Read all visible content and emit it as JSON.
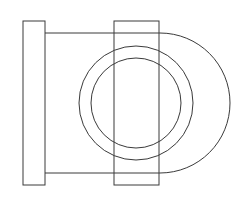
{
  "diagram": {
    "type": "technical-drawing",
    "stroke_color": "#3a3a3a",
    "background": "#ffffff",
    "left_flange": {
      "x": 23,
      "y": 21,
      "width": 22,
      "height": 164
    },
    "right_flange": {
      "x": 114,
      "y": 21,
      "width": 45,
      "height": 164
    },
    "top_line": {
      "x1": 45,
      "y1": 33,
      "x2": 160,
      "y2": 33
    },
    "bottom_line": {
      "x1": 45,
      "y1": 173,
      "x2": 160,
      "y2": 173
    },
    "outer_arc": {
      "cx": 160,
      "cy": 103,
      "r": 70
    },
    "middle_circle": {
      "cx": 136,
      "cy": 103,
      "r": 57
    },
    "inner_circle": {
      "cx": 136,
      "cy": 103,
      "r": 45
    }
  }
}
